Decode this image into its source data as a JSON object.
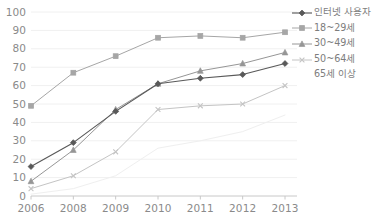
{
  "chart_data": {
    "type": "line",
    "title": "",
    "xlabel": "",
    "ylabel": "",
    "categories": [
      "2006",
      "2008",
      "2009",
      "2010",
      "2011",
      "2012",
      "2013"
    ],
    "ylim": [
      0,
      100
    ],
    "ytick_step": 10,
    "yticks": [
      "100",
      "90",
      "80",
      "70",
      "60",
      "50",
      "40",
      "30",
      "20",
      "10",
      "0"
    ],
    "grid": true,
    "legend_position": "right",
    "series": [
      {
        "name": "인터넷 사용자",
        "marker": "filled-diamond",
        "color": "#595959",
        "values": [
          16,
          29,
          46,
          61,
          64,
          66,
          72
        ]
      },
      {
        "name": "18~29세",
        "marker": "square",
        "color": "#a6a6a6",
        "values": [
          49,
          67,
          76,
          86,
          87,
          86,
          89
        ]
      },
      {
        "name": "30~49세",
        "marker": "triangle",
        "color": "#969696",
        "values": [
          8,
          25,
          47,
          61,
          68,
          72,
          78
        ]
      },
      {
        "name": "50~64세",
        "marker": "x-cross",
        "color": "#c4c4c4",
        "values": [
          4,
          11,
          24,
          47,
          49,
          50,
          60
        ]
      },
      {
        "name": "65세 이상",
        "marker": "none",
        "color": "#efefef",
        "values": [
          1,
          4,
          11,
          26,
          30,
          35,
          44
        ]
      }
    ]
  },
  "axis": {
    "color": "#c8c8c8",
    "grid_color": "#f0f0f0"
  }
}
